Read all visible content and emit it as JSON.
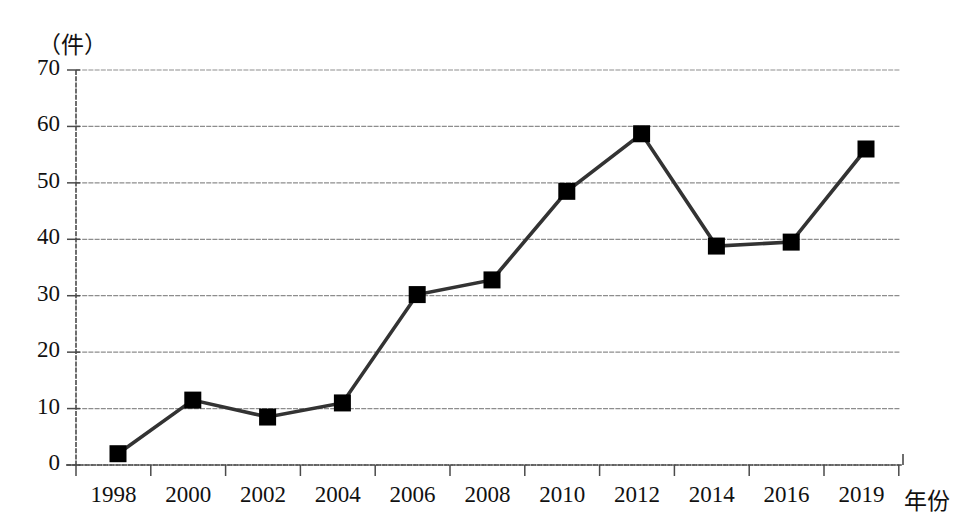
{
  "chart_data": {
    "type": "line",
    "title": "",
    "subtitle": "",
    "xlabel": "年份",
    "ylabel": "（件）",
    "ylim": [
      0,
      70
    ],
    "yticks": [
      0,
      10,
      20,
      30,
      40,
      50,
      60,
      70
    ],
    "grid": true,
    "legend": false,
    "legend_position": "none",
    "marker": "square",
    "marker_color": "#000000",
    "line_color": "#333333",
    "categories": [
      "1998",
      "2000",
      "2002",
      "2004",
      "2006",
      "2008",
      "2010",
      "2012",
      "2014",
      "2016",
      "2019"
    ],
    "values": [
      2,
      11.5,
      8.5,
      11,
      30.2,
      32.8,
      48.5,
      58.7,
      38.8,
      39.5,
      56
    ],
    "annotations": []
  },
  "axis": {
    "unit_label": "（件）",
    "x_axis_title": "年份",
    "y_tick_labels": [
      "70",
      "60",
      "50",
      "40",
      "30",
      "20",
      "10",
      "0"
    ],
    "x_tick_labels": [
      "1998",
      "2000",
      "2002",
      "2004",
      "2006",
      "2008",
      "2010",
      "2012",
      "2014",
      "2016",
      "2019"
    ]
  },
  "colors": {
    "background": "#ffffff",
    "grid": "#8d8d8d",
    "axis": "#4a4a4a",
    "series": "#333333",
    "marker": "#000000",
    "text": "#111111"
  }
}
